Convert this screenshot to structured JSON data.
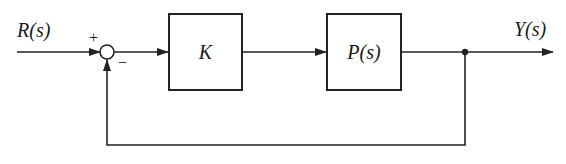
{
  "diagram": {
    "type": "feedback-control-block-diagram",
    "input_signal": {
      "label": "R(s)"
    },
    "summing_junction": {
      "plus_sign": "+",
      "minus_sign": "−"
    },
    "blocks": [
      {
        "id": "controller",
        "label": "K"
      },
      {
        "id": "plant",
        "label": "P(s)"
      }
    ],
    "output_signal": {
      "label": "Y(s)"
    },
    "feedback": {
      "type": "unity-negative"
    },
    "colors": {
      "line": "#222222",
      "background": "#ffffff"
    }
  }
}
